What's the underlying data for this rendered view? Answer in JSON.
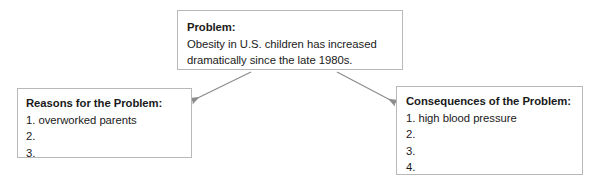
{
  "diagram": {
    "type": "problem-reasons-consequences-graphic-organizer",
    "background_color": "#ffffff",
    "border_color": "#b8b8b8",
    "arrow_color": "#8c8c8c",
    "text_color": "#1a1a1a",
    "nodes": {
      "problem": {
        "heading": "Problem:",
        "lines": [
          "Obesity in U.S. children has increased",
          "dramatically since the late 1980s."
        ]
      },
      "reasons": {
        "heading": "Reasons for the Problem:",
        "lines": [
          "1. overworked parents",
          "2.",
          "3."
        ]
      },
      "consequences": {
        "heading": "Consequences of the Problem:",
        "lines": [
          "1. high blood pressure",
          "2.",
          "3.",
          "4."
        ]
      }
    },
    "connectors": [
      {
        "from": "problem",
        "to": "reasons",
        "style": "arrow"
      },
      {
        "from": "problem",
        "to": "consequences",
        "style": "arrow"
      }
    ]
  }
}
